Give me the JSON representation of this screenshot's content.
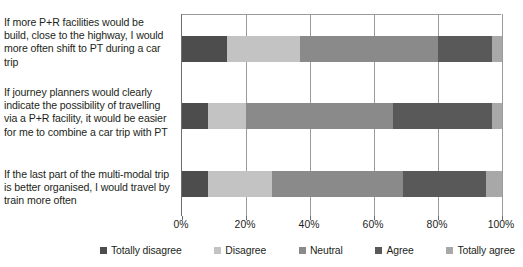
{
  "chart_data": {
    "type": "bar",
    "orientation": "horizontal",
    "stacked": true,
    "normalized_percent": true,
    "title": "",
    "subtitle": "",
    "xlabel": "",
    "ylabel": "",
    "xlim": [
      0,
      100
    ],
    "grid": true,
    "grid_axis": "x",
    "legend_position": "bottom",
    "xticks": [
      0,
      20,
      40,
      60,
      80,
      100
    ],
    "xtick_labels": [
      "0%",
      "20%",
      "40%",
      "60%",
      "80%",
      "100%"
    ],
    "categories": [
      "If more P+R facilities would be build, close to the highway, I would more often shift to PT during a car trip",
      "If journey planners would clearly indicate the possibility of travelling via a P+R facility, it would be easier for me to combine a car trip with PT",
      "If the last part of the multi-modal trip is better organised, I would travel by train more often"
    ],
    "series": [
      {
        "name": "Totally disagree",
        "color": "#4d4d4d",
        "values": [
          14,
          8,
          8
        ]
      },
      {
        "name": "Disagree",
        "color": "#c3c3c3",
        "values": [
          23,
          12,
          20
        ]
      },
      {
        "name": "Neutral",
        "color": "#8a8a8a",
        "values": [
          43,
          46,
          41
        ]
      },
      {
        "name": "Agree",
        "color": "#595959",
        "values": [
          17,
          31,
          26
        ]
      },
      {
        "name": "Totally agree",
        "color": "#a8a8a8",
        "values": [
          3,
          3,
          5
        ]
      }
    ]
  },
  "labels": {
    "category_0": "If more P+R facilities would be build, close to the highway, I would more often shift to PT during a car trip",
    "category_1": "If journey planners would clearly indicate the possibility of travelling via a P+R facility, it would be easier for me to combine a car trip with PT",
    "category_2": "If the last part of the multi-modal trip is better organised, I would travel by train more often"
  },
  "axis": {
    "tick_0": "0%",
    "tick_1": "20%",
    "tick_2": "40%",
    "tick_3": "60%",
    "tick_4": "80%",
    "tick_5": "100%"
  },
  "legend": {
    "items": [
      {
        "label": "Totally disagree",
        "color": "#4d4d4d"
      },
      {
        "label": "Disagree",
        "color": "#c3c3c3"
      },
      {
        "label": "Neutral",
        "color": "#8a8a8a"
      },
      {
        "label": "Agree",
        "color": "#595959"
      },
      {
        "label": "Totally agree",
        "color": "#a8a8a8"
      }
    ]
  },
  "colors": {
    "background": "#ffffff",
    "text": "#231f20",
    "gridline": "#9a9a9a",
    "axis": "#6e6e6e"
  }
}
